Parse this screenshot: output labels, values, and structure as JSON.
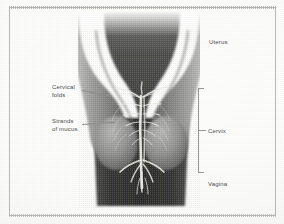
{
  "figure": {
    "style": "halftone grayscale medical illustration",
    "frame_color": "#b9b9b6",
    "background_color": "#fdfdfc"
  },
  "labels": {
    "uterus": "Uterus",
    "cervical_folds": "Cervical\nfolds",
    "strands_of_mucus": "Strands\nof mucus",
    "cervix": "Cervix",
    "vagina": "Vagina"
  },
  "anatomy": {
    "uterus_wall_color": "#8a8a88",
    "uterine_cavity_color": "#4a4a4a",
    "vagina_color": "#3f3f3f",
    "mucus_color": "#efeee9",
    "label_text_color": "#4c4c4c",
    "leader_line_color": "#8d8d8a"
  }
}
